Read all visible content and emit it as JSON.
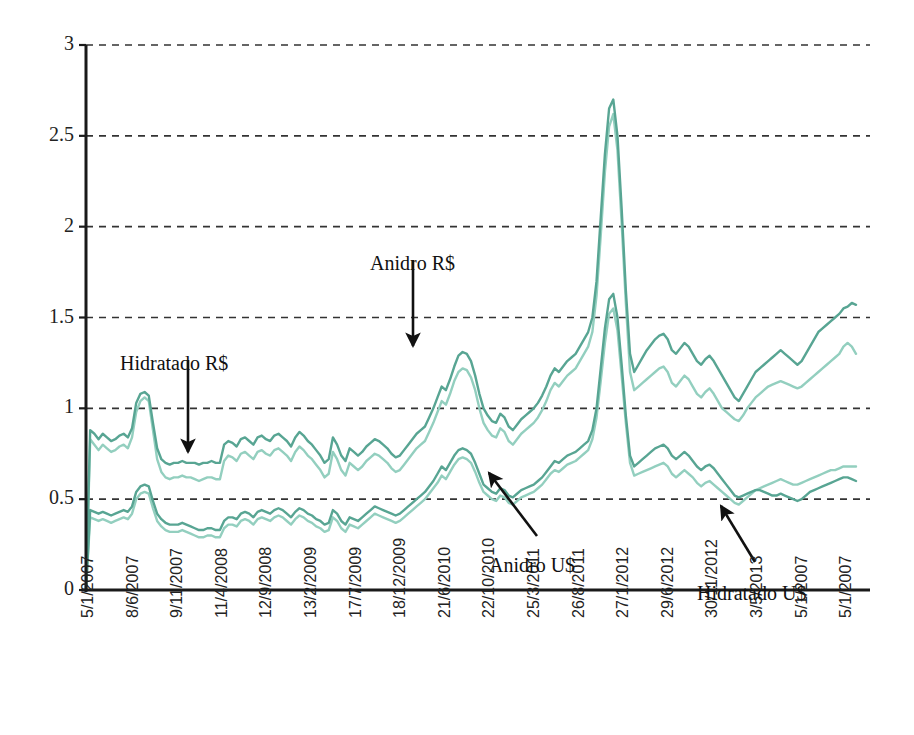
{
  "chart_data": {
    "type": "line",
    "title": "",
    "xlabel": "",
    "ylabel": "",
    "ylim": [
      0,
      3
    ],
    "yticks": [
      0,
      0.5,
      1,
      1.5,
      2,
      2.5,
      3
    ],
    "ytick_labels": [
      "0",
      "0.5",
      "1",
      "1.5",
      "2",
      "2.5",
      "3"
    ],
    "grid": "horizontal-dashed",
    "legend": "none (inline annotated arrows)",
    "xtick_labels": [
      "5/1/2007",
      "8/6/2007",
      "9/11/2007",
      "11/4/2008",
      "12/9/2008",
      "13/2/2009",
      "17/7/2009",
      "18/12/2009",
      "21/6/2010",
      "22/10/2010",
      "25/3/2011",
      "26/8/2011",
      "27/1/2012",
      "29/6/2012",
      "30/11/2012",
      "3/5/2013",
      "5/1/2007",
      "5/1/2007"
    ],
    "colors": {
      "dark_teal": "#58a593",
      "light_teal": "#93cfbf",
      "axis": "#1a1a1a",
      "grid": "#333333",
      "background": "#ffffff"
    },
    "annotations": [
      {
        "label": "Hidratado R$",
        "text_x": 120,
        "text_y": 352,
        "arrow_from": [
          188,
          360
        ],
        "arrow_to": [
          188,
          452
        ]
      },
      {
        "label": "Anidro R$",
        "text_x": 370,
        "text_y": 252,
        "arrow_from": [
          413,
          260
        ],
        "arrow_to": [
          413,
          346
        ]
      },
      {
        "label": "Anidro U$",
        "text_x": 489,
        "text_y": 554,
        "arrow_from": [
          537,
          536
        ],
        "arrow_to": [
          489,
          473
        ]
      },
      {
        "label": "Hidratado U$",
        "text_x": 697,
        "text_y": 582,
        "arrow_from": [
          755,
          562
        ],
        "arrow_to": [
          721,
          506
        ]
      }
    ],
    "series": [
      {
        "name": "Anidro R$",
        "color": "#58a593",
        "description": "Anhydrous ethanol price in Brazilian reais per litre",
        "values": [
          0.0,
          0.88,
          0.86,
          0.83,
          0.86,
          0.84,
          0.82,
          0.83,
          0.85,
          0.86,
          0.84,
          0.89,
          1.03,
          1.08,
          1.09,
          1.07,
          0.92,
          0.78,
          0.72,
          0.7,
          0.69,
          0.7,
          0.7,
          0.71,
          0.7,
          0.7,
          0.7,
          0.69,
          0.7,
          0.7,
          0.71,
          0.7,
          0.7,
          0.8,
          0.82,
          0.81,
          0.79,
          0.83,
          0.84,
          0.82,
          0.8,
          0.84,
          0.85,
          0.83,
          0.82,
          0.85,
          0.86,
          0.84,
          0.82,
          0.79,
          0.84,
          0.87,
          0.85,
          0.82,
          0.8,
          0.77,
          0.74,
          0.7,
          0.72,
          0.84,
          0.8,
          0.74,
          0.71,
          0.78,
          0.76,
          0.74,
          0.76,
          0.79,
          0.81,
          0.83,
          0.82,
          0.8,
          0.78,
          0.75,
          0.73,
          0.74,
          0.77,
          0.8,
          0.83,
          0.86,
          0.88,
          0.9,
          0.95,
          1.0,
          1.06,
          1.12,
          1.1,
          1.16,
          1.23,
          1.29,
          1.31,
          1.3,
          1.26,
          1.18,
          1.08,
          1.0,
          0.96,
          0.93,
          0.92,
          0.97,
          0.95,
          0.9,
          0.88,
          0.91,
          0.94,
          0.96,
          0.98,
          1.0,
          1.03,
          1.07,
          1.12,
          1.18,
          1.22,
          1.2,
          1.23,
          1.26,
          1.28,
          1.3,
          1.34,
          1.38,
          1.42,
          1.5,
          1.7,
          2.05,
          2.4,
          2.65,
          2.7,
          2.5,
          2.1,
          1.65,
          1.3,
          1.2,
          1.24,
          1.28,
          1.32,
          1.35,
          1.38,
          1.4,
          1.41,
          1.38,
          1.32,
          1.3,
          1.33,
          1.36,
          1.34,
          1.3,
          1.26,
          1.24,
          1.27,
          1.29,
          1.26,
          1.22,
          1.18,
          1.14,
          1.1,
          1.06,
          1.04,
          1.08,
          1.12,
          1.16,
          1.2,
          1.22,
          1.24,
          1.26,
          1.28,
          1.3,
          1.32,
          1.3,
          1.28,
          1.26,
          1.24,
          1.26,
          1.3,
          1.34,
          1.38,
          1.42,
          1.44,
          1.46,
          1.48,
          1.5,
          1.52,
          1.55,
          1.56,
          1.58,
          1.57
        ]
      },
      {
        "name": "Hidratado R$",
        "color": "#93cfbf",
        "description": "Hydrous ethanol price in Brazilian reais per litre",
        "values": [
          0.0,
          0.83,
          0.8,
          0.77,
          0.8,
          0.78,
          0.76,
          0.77,
          0.79,
          0.8,
          0.78,
          0.84,
          0.98,
          1.04,
          1.06,
          1.04,
          0.88,
          0.72,
          0.65,
          0.62,
          0.61,
          0.62,
          0.62,
          0.63,
          0.62,
          0.62,
          0.61,
          0.6,
          0.61,
          0.62,
          0.62,
          0.61,
          0.61,
          0.71,
          0.74,
          0.73,
          0.71,
          0.75,
          0.76,
          0.74,
          0.72,
          0.76,
          0.77,
          0.75,
          0.74,
          0.77,
          0.78,
          0.76,
          0.74,
          0.71,
          0.76,
          0.79,
          0.77,
          0.74,
          0.72,
          0.69,
          0.66,
          0.62,
          0.64,
          0.76,
          0.72,
          0.66,
          0.63,
          0.7,
          0.68,
          0.66,
          0.68,
          0.71,
          0.73,
          0.75,
          0.74,
          0.72,
          0.7,
          0.67,
          0.65,
          0.66,
          0.69,
          0.72,
          0.75,
          0.78,
          0.8,
          0.82,
          0.87,
          0.92,
          0.98,
          1.04,
          1.02,
          1.08,
          1.15,
          1.2,
          1.22,
          1.21,
          1.17,
          1.1,
          1.0,
          0.92,
          0.88,
          0.85,
          0.84,
          0.89,
          0.87,
          0.82,
          0.8,
          0.83,
          0.86,
          0.88,
          0.9,
          0.92,
          0.95,
          0.99,
          1.04,
          1.1,
          1.14,
          1.12,
          1.15,
          1.18,
          1.2,
          1.22,
          1.26,
          1.3,
          1.34,
          1.42,
          1.62,
          1.95,
          2.3,
          2.55,
          2.62,
          2.42,
          2.02,
          1.58,
          1.2,
          1.1,
          1.12,
          1.14,
          1.16,
          1.18,
          1.2,
          1.22,
          1.23,
          1.2,
          1.14,
          1.12,
          1.15,
          1.18,
          1.16,
          1.12,
          1.08,
          1.06,
          1.09,
          1.11,
          1.08,
          1.04,
          1.0,
          0.98,
          0.96,
          0.94,
          0.93,
          0.96,
          1.0,
          1.03,
          1.06,
          1.08,
          1.1,
          1.12,
          1.13,
          1.14,
          1.15,
          1.14,
          1.13,
          1.12,
          1.11,
          1.12,
          1.14,
          1.16,
          1.18,
          1.2,
          1.22,
          1.24,
          1.26,
          1.28,
          1.3,
          1.34,
          1.36,
          1.34,
          1.3
        ]
      },
      {
        "name": "Anidro U$",
        "color": "#58a593",
        "description": "Anhydrous ethanol price in US dollars per litre",
        "values": [
          0.0,
          0.44,
          0.43,
          0.42,
          0.43,
          0.42,
          0.41,
          0.42,
          0.43,
          0.44,
          0.43,
          0.46,
          0.54,
          0.57,
          0.58,
          0.57,
          0.49,
          0.42,
          0.39,
          0.37,
          0.36,
          0.36,
          0.36,
          0.37,
          0.36,
          0.35,
          0.34,
          0.33,
          0.33,
          0.34,
          0.34,
          0.33,
          0.33,
          0.38,
          0.4,
          0.4,
          0.39,
          0.42,
          0.43,
          0.42,
          0.4,
          0.43,
          0.44,
          0.43,
          0.42,
          0.44,
          0.45,
          0.44,
          0.42,
          0.4,
          0.43,
          0.45,
          0.44,
          0.42,
          0.41,
          0.39,
          0.38,
          0.36,
          0.37,
          0.44,
          0.42,
          0.38,
          0.36,
          0.4,
          0.39,
          0.38,
          0.4,
          0.42,
          0.44,
          0.46,
          0.45,
          0.44,
          0.43,
          0.42,
          0.41,
          0.42,
          0.44,
          0.46,
          0.48,
          0.5,
          0.52,
          0.54,
          0.57,
          0.6,
          0.64,
          0.68,
          0.66,
          0.7,
          0.74,
          0.77,
          0.78,
          0.77,
          0.75,
          0.7,
          0.64,
          0.58,
          0.56,
          0.54,
          0.53,
          0.56,
          0.55,
          0.52,
          0.51,
          0.53,
          0.55,
          0.56,
          0.57,
          0.58,
          0.6,
          0.62,
          0.65,
          0.68,
          0.71,
          0.7,
          0.72,
          0.74,
          0.75,
          0.76,
          0.78,
          0.8,
          0.82,
          0.88,
          1.0,
          1.22,
          1.44,
          1.6,
          1.63,
          1.5,
          1.24,
          0.96,
          0.74,
          0.68,
          0.7,
          0.72,
          0.74,
          0.76,
          0.78,
          0.79,
          0.8,
          0.78,
          0.74,
          0.72,
          0.74,
          0.76,
          0.74,
          0.71,
          0.68,
          0.66,
          0.68,
          0.69,
          0.67,
          0.64,
          0.61,
          0.58,
          0.55,
          0.52,
          0.51,
          0.52,
          0.53,
          0.54,
          0.55,
          0.55,
          0.54,
          0.53,
          0.52,
          0.52,
          0.53,
          0.52,
          0.51,
          0.5,
          0.49,
          0.5,
          0.52,
          0.54,
          0.55,
          0.56,
          0.57,
          0.58,
          0.59,
          0.6,
          0.61,
          0.62,
          0.62,
          0.61,
          0.6
        ]
      },
      {
        "name": "Hidratado U$",
        "color": "#93cfbf",
        "description": "Hydrous ethanol price in US dollars per litre",
        "values": [
          0.0,
          0.4,
          0.39,
          0.38,
          0.39,
          0.38,
          0.37,
          0.38,
          0.39,
          0.4,
          0.39,
          0.42,
          0.5,
          0.53,
          0.54,
          0.53,
          0.45,
          0.38,
          0.35,
          0.33,
          0.32,
          0.32,
          0.32,
          0.33,
          0.32,
          0.31,
          0.3,
          0.29,
          0.29,
          0.3,
          0.3,
          0.29,
          0.29,
          0.34,
          0.36,
          0.36,
          0.35,
          0.38,
          0.39,
          0.38,
          0.36,
          0.39,
          0.4,
          0.39,
          0.38,
          0.4,
          0.41,
          0.4,
          0.38,
          0.36,
          0.39,
          0.41,
          0.4,
          0.38,
          0.37,
          0.35,
          0.34,
          0.32,
          0.33,
          0.4,
          0.38,
          0.34,
          0.32,
          0.36,
          0.35,
          0.34,
          0.36,
          0.38,
          0.4,
          0.42,
          0.41,
          0.4,
          0.39,
          0.38,
          0.37,
          0.38,
          0.4,
          0.42,
          0.44,
          0.46,
          0.48,
          0.5,
          0.53,
          0.56,
          0.59,
          0.63,
          0.61,
          0.65,
          0.69,
          0.72,
          0.73,
          0.72,
          0.7,
          0.65,
          0.59,
          0.54,
          0.52,
          0.5,
          0.49,
          0.52,
          0.51,
          0.48,
          0.47,
          0.49,
          0.51,
          0.52,
          0.53,
          0.54,
          0.56,
          0.58,
          0.61,
          0.64,
          0.66,
          0.65,
          0.67,
          0.69,
          0.7,
          0.71,
          0.73,
          0.75,
          0.77,
          0.83,
          0.95,
          1.15,
          1.36,
          1.52,
          1.55,
          1.43,
          1.18,
          0.92,
          0.7,
          0.63,
          0.64,
          0.65,
          0.66,
          0.67,
          0.68,
          0.69,
          0.7,
          0.68,
          0.64,
          0.62,
          0.64,
          0.66,
          0.64,
          0.62,
          0.59,
          0.57,
          0.59,
          0.6,
          0.58,
          0.56,
          0.54,
          0.52,
          0.5,
          0.48,
          0.47,
          0.49,
          0.51,
          0.53,
          0.55,
          0.56,
          0.57,
          0.58,
          0.59,
          0.6,
          0.61,
          0.6,
          0.59,
          0.58,
          0.58,
          0.59,
          0.6,
          0.61,
          0.62,
          0.63,
          0.64,
          0.65,
          0.66,
          0.66,
          0.67,
          0.68,
          0.68,
          0.68,
          0.68
        ]
      }
    ]
  }
}
